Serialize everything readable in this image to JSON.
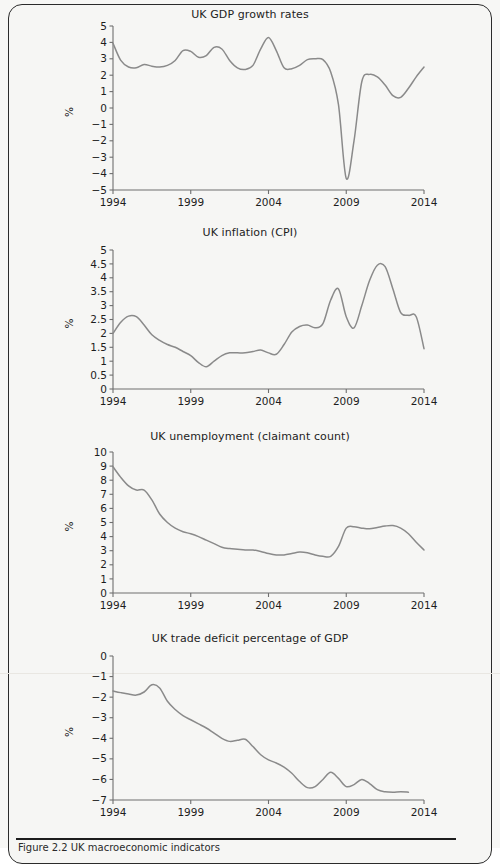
{
  "figure": {
    "caption": "Figure 2.2  UK macroeconomic indicators",
    "y_axis_name": "%",
    "line_color": "#8a8a8a",
    "axis_color": "#6f6f6f",
    "background": "#f6f6f4"
  },
  "chart_data": [
    {
      "id": "uk-gdp-growth-rates",
      "type": "line",
      "title": "UK GDP growth rates",
      "xlabel": "",
      "ylabel": "%",
      "xlim": [
        1994,
        2014
      ],
      "ylim": [
        -5,
        5
      ],
      "ytick_step": 1,
      "xticks": [
        1994,
        1999,
        2004,
        2009,
        2014
      ],
      "xtick_labels": [
        "1994",
        "1999",
        "2004",
        "2009",
        "2014"
      ],
      "yticks": [
        -5,
        -4,
        -3,
        -2,
        -1,
        0,
        1,
        2,
        3,
        4,
        5
      ],
      "ytick_labels": [
        "−5",
        "−4",
        "−3",
        "−2",
        "−1",
        "0",
        "1",
        "2",
        "3",
        "4",
        "5"
      ],
      "grid": false,
      "legend": "none",
      "x": [
        1994.0,
        1994.5,
        1995.0,
        1995.5,
        1996.0,
        1996.5,
        1997.0,
        1997.5,
        1998.0,
        1998.5,
        1999.0,
        1999.5,
        2000.0,
        2000.5,
        2001.0,
        2001.5,
        2002.0,
        2002.5,
        2003.0,
        2003.5,
        2004.0,
        2004.5,
        2005.0,
        2005.5,
        2006.0,
        2006.5,
        2007.0,
        2007.5,
        2008.0,
        2008.5,
        2009.0,
        2009.5,
        2010.0,
        2010.5,
        2011.0,
        2011.5,
        2012.0,
        2012.5,
        2013.0,
        2013.5,
        2014.0
      ],
      "y": [
        3.95,
        2.9,
        2.5,
        2.45,
        2.65,
        2.55,
        2.5,
        2.6,
        2.9,
        3.5,
        3.45,
        3.1,
        3.2,
        3.7,
        3.6,
        2.9,
        2.45,
        2.35,
        2.6,
        3.6,
        4.3,
        3.5,
        2.45,
        2.4,
        2.6,
        2.95,
        3.0,
        2.95,
        2.2,
        0.2,
        -4.3,
        -2.0,
        1.6,
        2.05,
        1.9,
        1.4,
        0.75,
        0.65,
        1.2,
        1.9,
        2.5
      ]
    },
    {
      "id": "uk-inflation-cpi",
      "type": "line",
      "title": "UK inflation (CPI)",
      "xlabel": "",
      "ylabel": "%",
      "xlim": [
        1994,
        2014
      ],
      "ylim": [
        0,
        5
      ],
      "ytick_step": 0.5,
      "xticks": [
        1994,
        1999,
        2004,
        2009,
        2014
      ],
      "xtick_labels": [
        "1994",
        "1999",
        "2004",
        "2009",
        "2014"
      ],
      "yticks": [
        0,
        0.5,
        1,
        1.5,
        2,
        2.5,
        3,
        3.5,
        4,
        4.5,
        5
      ],
      "ytick_labels": [
        "0",
        "0.5",
        "1",
        "1.5",
        "2",
        "2.5",
        "3",
        "3.5",
        "4",
        "4.5",
        "5"
      ],
      "grid": false,
      "legend": "none",
      "x": [
        1994.0,
        1994.5,
        1995.0,
        1995.5,
        1996.0,
        1996.5,
        1997.0,
        1997.5,
        1998.0,
        1998.5,
        1999.0,
        1999.5,
        2000.0,
        2000.5,
        2001.0,
        2001.5,
        2002.0,
        2002.5,
        2003.0,
        2003.5,
        2004.0,
        2004.5,
        2005.0,
        2005.5,
        2006.0,
        2006.5,
        2007.0,
        2007.5,
        2008.0,
        2008.5,
        2009.0,
        2009.5,
        2010.0,
        2010.5,
        2011.0,
        2011.5,
        2012.0,
        2012.5,
        2013.0,
        2013.5,
        2014.0
      ],
      "y": [
        2.0,
        2.4,
        2.62,
        2.6,
        2.3,
        1.95,
        1.75,
        1.6,
        1.5,
        1.35,
        1.2,
        0.95,
        0.8,
        1.0,
        1.2,
        1.3,
        1.3,
        1.3,
        1.35,
        1.4,
        1.3,
        1.25,
        1.6,
        2.05,
        2.25,
        2.3,
        2.2,
        2.35,
        3.2,
        3.6,
        2.6,
        2.2,
        3.0,
        3.9,
        4.45,
        4.4,
        3.6,
        2.75,
        2.65,
        2.6,
        1.45
      ]
    },
    {
      "id": "uk-unemployment-claimant-count",
      "type": "line",
      "title": "UK unemployment (claimant count)",
      "xlabel": "",
      "ylabel": "%",
      "xlim": [
        1994,
        2014
      ],
      "ylim": [
        0,
        10
      ],
      "ytick_step": 1,
      "xticks": [
        1994,
        1999,
        2004,
        2009,
        2014
      ],
      "xtick_labels": [
        "1994",
        "1999",
        "2004",
        "2009",
        "2014"
      ],
      "yticks": [
        0,
        1,
        2,
        3,
        4,
        5,
        6,
        7,
        8,
        9,
        10
      ],
      "ytick_labels": [
        "0",
        "1",
        "2",
        "3",
        "4",
        "5",
        "6",
        "7",
        "8",
        "9",
        "10"
      ],
      "grid": false,
      "legend": "none",
      "x": [
        1994.0,
        1994.5,
        1995.0,
        1995.5,
        1996.0,
        1996.5,
        1997.0,
        1997.5,
        1998.0,
        1998.5,
        1999.0,
        1999.5,
        2000.0,
        2000.5,
        2001.0,
        2001.5,
        2002.0,
        2002.5,
        2003.0,
        2003.5,
        2004.0,
        2004.5,
        2005.0,
        2005.5,
        2006.0,
        2006.5,
        2007.0,
        2007.5,
        2008.0,
        2008.5,
        2009.0,
        2009.5,
        2010.0,
        2010.5,
        2011.0,
        2011.5,
        2012.0,
        2012.5,
        2013.0,
        2013.5,
        2014.0
      ],
      "y": [
        8.95,
        8.2,
        7.6,
        7.3,
        7.3,
        6.6,
        5.6,
        5.0,
        4.6,
        4.35,
        4.2,
        4.0,
        3.75,
        3.5,
        3.25,
        3.15,
        3.1,
        3.05,
        3.05,
        2.95,
        2.8,
        2.7,
        2.7,
        2.8,
        2.9,
        2.85,
        2.7,
        2.6,
        2.6,
        3.3,
        4.6,
        4.7,
        4.6,
        4.55,
        4.65,
        4.75,
        4.78,
        4.6,
        4.2,
        3.6,
        3.05
      ]
    },
    {
      "id": "uk-trade-deficit-percentage-of-gdp",
      "type": "line",
      "title": "UK trade deficit percentage of GDP",
      "xlabel": "",
      "ylabel": "%",
      "xlim": [
        1994,
        2014
      ],
      "ylim": [
        -7,
        0
      ],
      "ytick_step": 1,
      "xticks": [
        1994,
        1999,
        2004,
        2009,
        2014
      ],
      "xtick_labels": [
        "1994",
        "1999",
        "2004",
        "2009",
        "2014"
      ],
      "yticks": [
        -7,
        -6,
        -5,
        -4,
        -3,
        -2,
        -1,
        0
      ],
      "ytick_labels": [
        "−7",
        "−6",
        "−5",
        "−4",
        "−3",
        "−2",
        "−1",
        "0"
      ],
      "grid": false,
      "legend": "none",
      "x": [
        1994.0,
        1994.5,
        1995.0,
        1995.5,
        1996.0,
        1996.5,
        1997.0,
        1997.5,
        1998.0,
        1998.5,
        1999.0,
        1999.5,
        2000.0,
        2000.5,
        2001.0,
        2001.5,
        2002.0,
        2002.5,
        2003.0,
        2003.5,
        2004.0,
        2004.5,
        2005.0,
        2005.5,
        2006.0,
        2006.5,
        2007.0,
        2007.5,
        2008.0,
        2008.5,
        2009.0,
        2009.5,
        2010.0,
        2010.5,
        2011.0,
        2011.5,
        2012.0,
        2012.5,
        2013.0
      ],
      "y": [
        -1.7,
        -1.78,
        -1.85,
        -1.9,
        -1.75,
        -1.4,
        -1.55,
        -2.2,
        -2.6,
        -2.9,
        -3.1,
        -3.3,
        -3.5,
        -3.75,
        -4.0,
        -4.15,
        -4.1,
        -4.05,
        -4.4,
        -4.8,
        -5.05,
        -5.2,
        -5.4,
        -5.7,
        -6.1,
        -6.4,
        -6.35,
        -6.0,
        -5.65,
        -5.95,
        -6.35,
        -6.25,
        -6.0,
        -6.2,
        -6.5,
        -6.6,
        -6.62,
        -6.6,
        -6.62
      ]
    }
  ]
}
